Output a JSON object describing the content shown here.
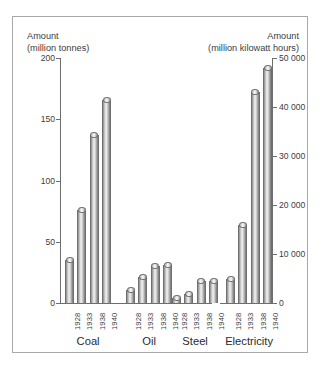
{
  "chart_data": {
    "type": "bar",
    "title": "",
    "categories": [
      "1928",
      "1933",
      "1938",
      "1940"
    ],
    "groups": [
      {
        "name": "Coal",
        "axis": "left",
        "unit": "million tonnes",
        "values": [
          35,
          76,
          137,
          166
        ]
      },
      {
        "name": "Oil",
        "axis": "left",
        "unit": "million tonnes",
        "values": [
          11,
          21,
          30,
          31
        ]
      },
      {
        "name": "Steel",
        "axis": "left",
        "unit": "million tonnes",
        "values": [
          4,
          7,
          18,
          18
        ]
      },
      {
        "name": "Electricity",
        "axis": "right",
        "unit": "million kilowatt hours",
        "values": [
          5000,
          16000,
          43000,
          48000
        ]
      }
    ],
    "left_axis": {
      "label_line1": "Amount",
      "label_line2": "(million tonnes)",
      "ticks": [
        "0",
        "50",
        "100",
        "150",
        "200"
      ],
      "tick_values": [
        0,
        50,
        100,
        150,
        200
      ],
      "ylim": [
        0,
        200
      ]
    },
    "right_axis": {
      "label_line1": "Amount",
      "label_line2": "(million kilowatt hours)",
      "ticks": [
        "0",
        "10 000",
        "20 000",
        "30 000",
        "40 000",
        "50 000"
      ],
      "tick_values": [
        0,
        10000,
        20000,
        30000,
        40000,
        50000
      ],
      "ylim": [
        0,
        50000
      ]
    },
    "xlabel": "",
    "ylabel": "Amount",
    "grid": false,
    "legend": "none",
    "colors": {
      "bar_light": "#f2f2f2",
      "bar_mid": "#b5b5b5",
      "bar_dark": "#757575",
      "axis": "#6e6e6e",
      "text": "#3d3d3d",
      "frame": "#a9a9a9",
      "background": "#ffffff"
    }
  }
}
